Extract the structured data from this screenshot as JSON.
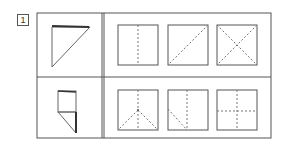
{
  "problem": {
    "number_label": "1",
    "rows": [
      {
        "folded_shape": "triangle-fold",
        "options": [
          {
            "id": "A",
            "pattern": "vertical-center-dashed"
          },
          {
            "id": "B",
            "pattern": "diagonal-dashed"
          },
          {
            "id": "C",
            "pattern": "x-cross-dashed"
          }
        ]
      },
      {
        "folded_shape": "square-with-triangle-flap",
        "options": [
          {
            "id": "A",
            "pattern": "vertical-center-with-two-diagonals-from-center-dashed"
          },
          {
            "id": "B",
            "pattern": "vertical-center-with-left-diagonal-dashed"
          },
          {
            "id": "C",
            "pattern": "plus-cross-dashed"
          }
        ]
      }
    ]
  },
  "colors": {
    "line": "#555555",
    "dashed": "#777777",
    "fold_edge": "#333333",
    "background": "#ffffff"
  }
}
